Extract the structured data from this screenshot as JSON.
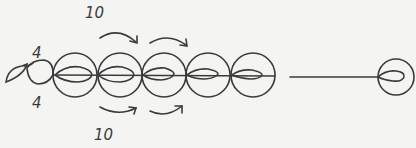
{
  "diagram": {
    "labels": {
      "top_count": "10",
      "bottom_count": "10",
      "left_top": "4",
      "left_bottom": "4"
    },
    "colors": {
      "stroke": "#3a3a3a",
      "background": "#f4f4f2"
    },
    "elements": {
      "circles_in_row": 5,
      "end_circle": 1,
      "arrows_top": 2,
      "arrows_bottom": 2
    }
  }
}
